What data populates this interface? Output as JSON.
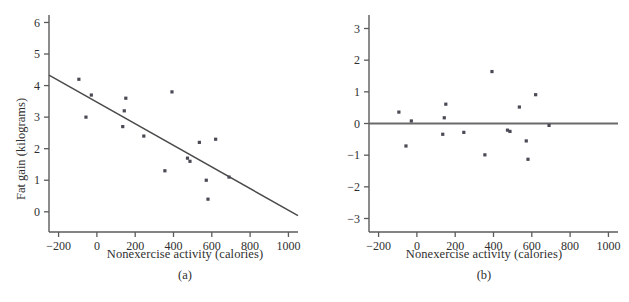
{
  "figure": {
    "panels": [
      {
        "id": "a",
        "panel_label": "(a)",
        "x_title": "Nonexercise activity (calories)",
        "y_title": "Fat gain (kilograms)"
      },
      {
        "id": "b",
        "panel_label": "(b)",
        "x_title": "Nonexercise activity (calories)",
        "y_title": "Residual"
      }
    ]
  },
  "colors": {
    "point": "#4a4a55",
    "axis": "#5b5b5b",
    "fit_line": "#4a4a4a",
    "zero_line": "#6a6a6a",
    "background": "#ffffff",
    "text": "#2f2f2f"
  },
  "chart_data": [
    {
      "type": "scatter",
      "id": "a",
      "title": "",
      "xlabel": "Nonexercise activity (calories)",
      "ylabel": "Fat gain (kilograms)",
      "annotation": "(a)",
      "xlim": [
        -250,
        1050
      ],
      "ylim": [
        -0.45,
        6.3
      ],
      "xticks": [
        -200,
        0,
        200,
        400,
        600,
        800,
        1000
      ],
      "xticklabels": [
        "−200",
        "0",
        "200",
        "400",
        "600",
        "800",
        "1000"
      ],
      "yticks": [
        0,
        1,
        2,
        3,
        4,
        5,
        6
      ],
      "yticklabels": [
        "0",
        "1",
        "2",
        "3",
        "4",
        "5",
        "6"
      ],
      "grid": false,
      "legend": null,
      "x": [
        -94,
        -57,
        -29,
        135,
        143,
        151,
        245,
        355,
        392,
        473,
        486,
        535,
        571,
        580,
        620,
        690
      ],
      "y": [
        4.2,
        3.0,
        3.7,
        2.7,
        3.2,
        3.6,
        2.4,
        1.3,
        3.8,
        1.7,
        1.6,
        2.2,
        1.0,
        0.4,
        2.3,
        1.1
      ],
      "fit_line": {
        "label": "least-squares regression line",
        "x": [
          -250,
          1050
        ],
        "y": [
          4.33,
          -0.12
        ],
        "slope": -0.0034,
        "intercept": 3.48
      }
    },
    {
      "type": "scatter",
      "id": "b",
      "title": "",
      "xlabel": "Nonexercise activity (calories)",
      "ylabel": "Residual",
      "annotation": "(b)",
      "xlim": [
        -250,
        1050
      ],
      "ylim": [
        -3.3,
        3.3
      ],
      "xticks": [
        -200,
        0,
        200,
        400,
        600,
        800,
        1000
      ],
      "xticklabels": [
        "−200",
        "0",
        "200",
        "400",
        "600",
        "800",
        "1000"
      ],
      "yticks": [
        3,
        2,
        1,
        0,
        -1,
        -2,
        -3
      ],
      "yticklabels": [
        "3",
        "2",
        "1",
        "0",
        "−1",
        "−2",
        "−3"
      ],
      "grid": false,
      "legend": null,
      "x": [
        -94,
        -57,
        -29,
        135,
        143,
        151,
        245,
        355,
        392,
        473,
        486,
        535,
        571,
        580,
        620,
        690
      ],
      "y": [
        0.36,
        -0.71,
        0.08,
        -0.34,
        0.18,
        0.61,
        -0.28,
        -0.99,
        1.64,
        -0.21,
        -0.25,
        0.52,
        -0.55,
        -1.13,
        0.91,
        -0.06
      ],
      "zero_line": {
        "label": "residual = 0 reference line",
        "y": 0
      }
    }
  ]
}
